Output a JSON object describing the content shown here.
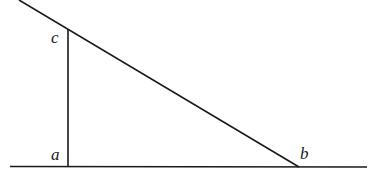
{
  "diagram": {
    "labels": {
      "a": "a",
      "b": "b",
      "c": "c"
    },
    "points": {
      "a": [
        68,
        166
      ],
      "b": [
        299,
        167
      ],
      "c": [
        68,
        29
      ]
    },
    "lines": {
      "baseline": [
        [
          10,
          166
        ],
        [
          367,
          167
        ]
      ],
      "vertical": [
        [
          68,
          29
        ],
        [
          68,
          166
        ]
      ],
      "diagonal": [
        [
          19,
          0
        ],
        [
          299,
          167
        ]
      ]
    },
    "stroke_color": "#1a1a1a"
  }
}
